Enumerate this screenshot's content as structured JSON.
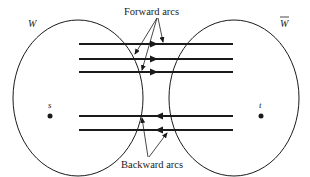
{
  "diagram": {
    "sets": {
      "left": {
        "label": "W"
      },
      "right": {
        "label": "W",
        "overline": true
      }
    },
    "nodes": {
      "source": {
        "label": "s"
      },
      "sink": {
        "label": "t"
      }
    },
    "arcs": {
      "forward": {
        "label": "Forward arcs",
        "count": 3,
        "direction": "W to W-bar"
      },
      "backward": {
        "label": "Backward arcs",
        "count": 2,
        "direction": "W-bar to W"
      }
    },
    "colors": {
      "stroke": "#1a1a1a",
      "background": "#ffffff"
    }
  }
}
